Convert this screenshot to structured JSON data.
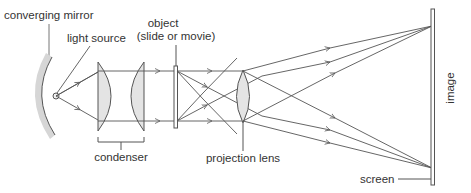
{
  "labels": {
    "converging_mirror": "converging mirror",
    "light_source": "light source",
    "object_line1": "object",
    "object_line2": "(slide or movie)",
    "condenser": "condenser",
    "projection_lens": "projection lens",
    "screen": "screen",
    "image": "image"
  },
  "colors": {
    "line": "#555555",
    "lens_fill": "#e4e4e4",
    "mirror_fill": "#d6d6d6",
    "text": "#333333"
  }
}
